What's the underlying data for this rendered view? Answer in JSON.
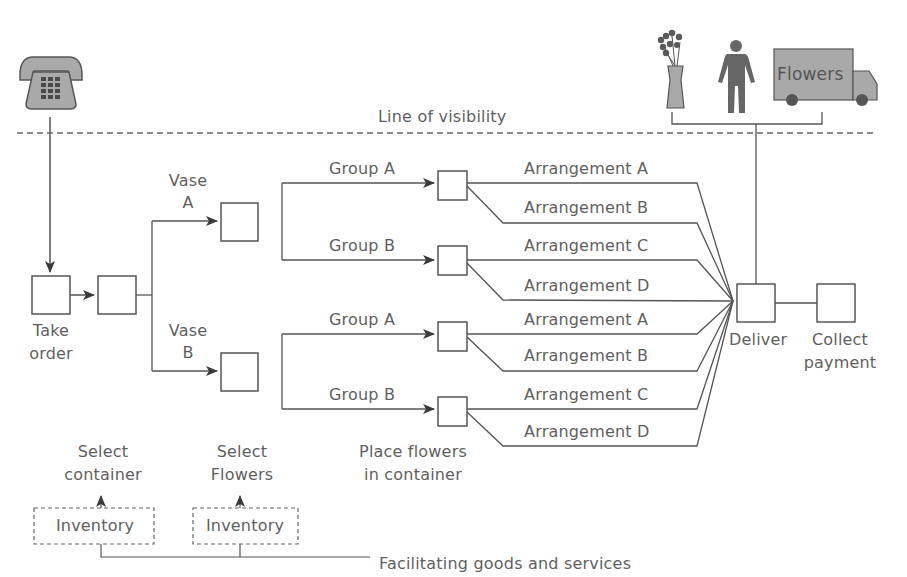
{
  "diagram": {
    "type": "service-blueprint",
    "line_of_visibility": "Line of visibility",
    "facilitating": "Facilitating goods and services",
    "colors": {
      "line": "#555555",
      "icon_fill": "#a9a9a9",
      "icon_dark": "#4a4a4a",
      "text": "#5f5f5f"
    },
    "icons": {
      "phone": "telephone-icon",
      "vase": "vase-with-flowers-icon",
      "person": "delivery-person-icon",
      "truck": "delivery-truck-icon",
      "truck_text": "Flowers"
    },
    "steps": {
      "take_order": {
        "line1": "Take",
        "line2": "order"
      },
      "vase_a": {
        "line1": "Vase",
        "line2": "A"
      },
      "vase_b": {
        "line1": "Vase",
        "line2": "B"
      },
      "place_flowers": {
        "line1": "Place flowers",
        "line2": "in container"
      },
      "deliver": "Deliver",
      "collect_payment": {
        "line1": "Collect",
        "line2": "payment"
      }
    },
    "upper_groups": [
      {
        "label": "Group A",
        "arrangements": [
          "Arrangement A",
          "Arrangement B"
        ]
      },
      {
        "label": "Group B",
        "arrangements": [
          "Arrangement C",
          "Arrangement D"
        ]
      }
    ],
    "lower_groups": [
      {
        "label": "Group A",
        "arrangements": [
          "Arrangement A",
          "Arrangement B"
        ]
      },
      {
        "label": "Group B",
        "arrangements": [
          "Arrangement C",
          "Arrangement D"
        ]
      }
    ],
    "support": {
      "select_container": {
        "line1": "Select",
        "line2": "container"
      },
      "select_flowers": {
        "line1": "Select",
        "line2": "Flowers"
      },
      "inventory_1": "Inventory",
      "inventory_2": "Inventory"
    }
  }
}
